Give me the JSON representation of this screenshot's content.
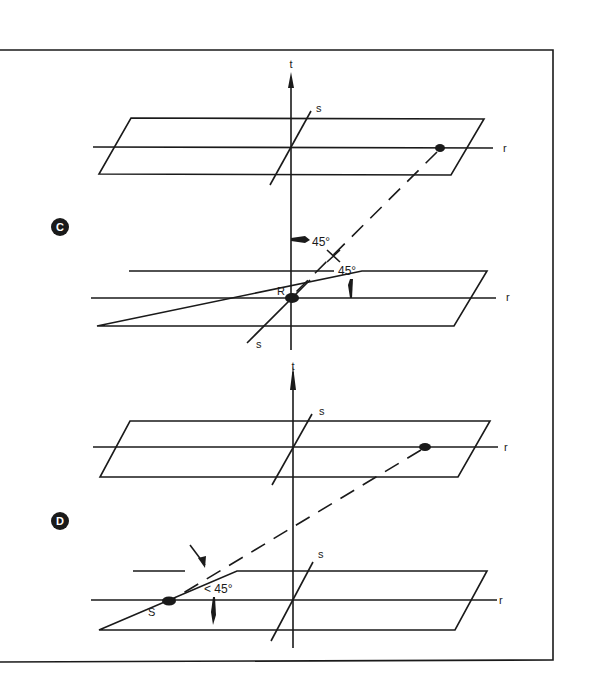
{
  "colors": {
    "ink": "#1a1a1a",
    "background": "#ffffff"
  },
  "panels": [
    {
      "id": "C",
      "badge": "C",
      "upper_plane": {
        "r_label": "r",
        "s_label": "s",
        "t_label": "t"
      },
      "lower_plane": {
        "r_label": "r",
        "s_label": "s",
        "point_label": "R"
      },
      "angle_labels": [
        "45°",
        "45°"
      ]
    },
    {
      "id": "D",
      "badge": "D",
      "upper_plane": {
        "r_label": "r",
        "s_label": "s",
        "t_label": "t"
      },
      "lower_plane": {
        "r_label": "r",
        "s_label": "s",
        "point_label": "S"
      },
      "angle_labels": [
        "< 45°"
      ]
    }
  ]
}
